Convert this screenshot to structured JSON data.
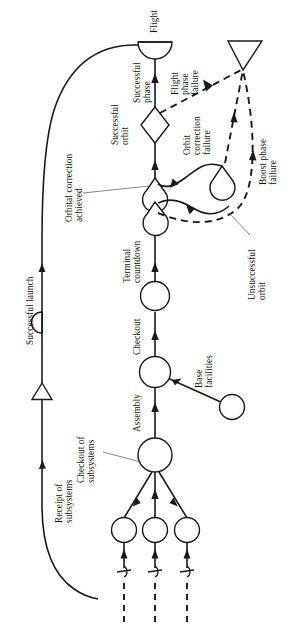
{
  "diagram": {
    "type": "activity-network",
    "orientation": "rotated-90-ccw",
    "colors": {
      "stroke": "#1a1a1a",
      "background": "#ffffff",
      "leader": "#555555"
    },
    "labels": {
      "flight": "Flight",
      "successful_phase": "Successful phase",
      "successful_orbit": "Successful orbit",
      "flight_phase_failure": "Flight phase failure",
      "orbit_correction_failure": "Orbit correction failure",
      "boost_phase_failure": "Boost phase failure",
      "unsuccessful_orbit": "Unsuccessful orbit",
      "orbital_correction_achieved": "Orbital correction achieved",
      "terminal_countdown": "Terminal countdown",
      "checkout": "Checkout",
      "assembly": "Assembly",
      "base_facilities": "Base facilities",
      "checkout_of_subsystems": "Checkout of subsystems",
      "receipt_of_subsystems": "Receipt of subsystems",
      "successful_launch": "Successful launch"
    },
    "label_lines": {
      "flight": [
        "Flight"
      ],
      "successful_phase": [
        "Successful",
        "phase"
      ],
      "successful_orbit": [
        "Successful",
        "orbit"
      ],
      "flight_phase_failure": [
        "Flight",
        "phase",
        "failure"
      ],
      "orbit_correction_failure": [
        "Orbit",
        "correction",
        "failure"
      ],
      "boost_phase_failure": [
        "Boost phase",
        "failure"
      ],
      "unsuccessful_orbit": [
        "Unsuccessful",
        "orbit"
      ],
      "orbital_correction_achieved": [
        "Orbital correction",
        "achieved"
      ],
      "terminal_countdown": [
        "Terminal",
        "countdown"
      ],
      "checkout": [
        "Checkout"
      ],
      "assembly": [
        "Assembly"
      ],
      "base_facilities": [
        "Base",
        "facilities"
      ],
      "checkout_of_subsystems": [
        "Checkout of",
        "subsystems"
      ],
      "receipt_of_subsystems": [
        "Receipt of",
        "subsystems"
      ],
      "successful_launch": [
        "Successful launch"
      ]
    },
    "nodes": [
      {
        "id": "flight",
        "shape": "half-disc",
        "label": "Flight"
      },
      {
        "id": "decision",
        "shape": "diamond",
        "label": ""
      },
      {
        "id": "orbit-correct-left",
        "shape": "teardrop",
        "label": ""
      },
      {
        "id": "terminal",
        "shape": "teardrop",
        "label": ""
      },
      {
        "id": "countdown-circle",
        "shape": "circle",
        "label": ""
      },
      {
        "id": "checkout-circle",
        "shape": "circle",
        "label": ""
      },
      {
        "id": "assembly-circle",
        "shape": "circle",
        "label": ""
      },
      {
        "id": "base-facilities-circle",
        "shape": "circle",
        "label": "Base facilities"
      },
      {
        "id": "subsystem-circle-1",
        "shape": "circle",
        "label": ""
      },
      {
        "id": "subsystem-circle-2",
        "shape": "circle",
        "label": ""
      },
      {
        "id": "subsystem-circle-3",
        "shape": "circle",
        "label": ""
      },
      {
        "id": "failure-triangle",
        "shape": "triangle",
        "label": ""
      },
      {
        "id": "launch-triangle",
        "shape": "triangle",
        "label": ""
      },
      {
        "id": "orbit-correct-right",
        "shape": "teardrop",
        "label": ""
      },
      {
        "id": "half-disc-left",
        "shape": "half-disc",
        "label": ""
      }
    ],
    "edges": [
      {
        "from": "decision",
        "to": "flight",
        "style": "solid",
        "label": "Successful phase"
      },
      {
        "from": "terminal",
        "to": "decision",
        "style": "solid",
        "label": "Successful orbit"
      },
      {
        "from": "failure-triangle",
        "to": "decision",
        "style": "dashed",
        "label": "Flight phase failure"
      },
      {
        "from": "orbit-correct-right",
        "to": "failure-triangle",
        "style": "dashed",
        "label": "Orbit correction failure"
      },
      {
        "from": "orbit-correct-right",
        "to": "failure-triangle",
        "style": "dashed",
        "label": "Boost phase failure"
      },
      {
        "from": "terminal",
        "to": "orbit-correct-right",
        "style": "dashed",
        "label": "Unsuccessful orbit"
      },
      {
        "from": "countdown-circle",
        "to": "terminal",
        "style": "solid",
        "label": "Terminal countdown"
      },
      {
        "from": "checkout-circle",
        "to": "countdown-circle",
        "style": "solid",
        "label": "Checkout"
      },
      {
        "from": "assembly-circle",
        "to": "checkout-circle",
        "style": "solid",
        "label": "Assembly"
      },
      {
        "from": "base-facilities-circle",
        "to": "checkout-circle",
        "style": "solid",
        "label": "Base facilities"
      },
      {
        "from": "subsystem-circle-1",
        "to": "assembly-circle",
        "style": "solid",
        "label": "Checkout of subsystems"
      },
      {
        "from": "subsystem-circle-2",
        "to": "assembly-circle",
        "style": "solid",
        "label": ""
      },
      {
        "from": "subsystem-circle-3",
        "to": "assembly-circle",
        "style": "solid",
        "label": ""
      },
      {
        "from": "flight",
        "to": "launch-triangle",
        "style": "solid-curve",
        "label": "Successful launch"
      }
    ]
  }
}
